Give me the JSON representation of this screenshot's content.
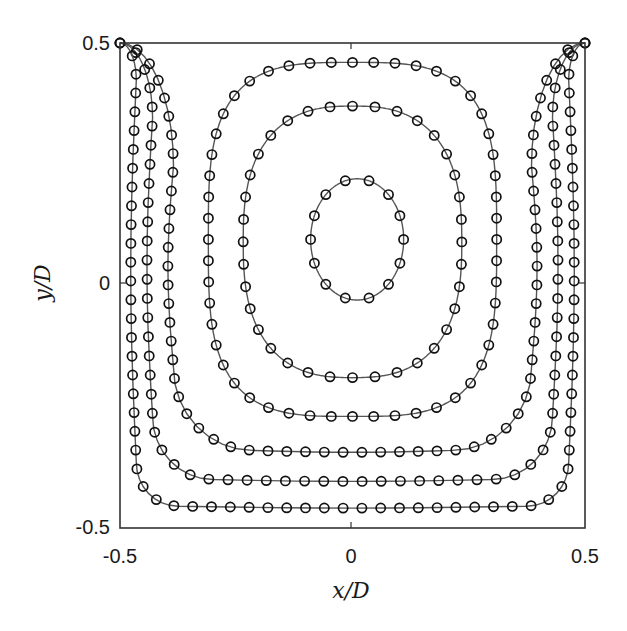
{
  "chart_data": {
    "type": "line",
    "title": "",
    "xlabel": "x/D",
    "ylabel": "y/D",
    "xlim": [
      -0.5,
      0.5
    ],
    "ylim": [
      -0.5,
      0.5
    ],
    "grid": false,
    "legend": null,
    "x_ticks": [
      -0.5,
      0,
      0.5
    ],
    "x_tick_labels": [
      "-0.5",
      "0",
      "0.5"
    ],
    "y_ticks": [
      -0.5,
      0,
      0.5
    ],
    "y_tick_labels": [
      "-0.5",
      "0",
      "0.5"
    ],
    "marker": "open-circle",
    "line_color": "#555555",
    "marker_color": "#111111",
    "series": [
      {
        "name": "contour-1 (closed, innermost)",
        "closed": true,
        "cx": 0.01,
        "cy": 0.095,
        "rx": 0.1,
        "ry": 0.125,
        "n_markers": 14,
        "extent": {
          "xmin": -0.09,
          "xmax": 0.11,
          "ymin": -0.03,
          "ymax": 0.22
        }
      },
      {
        "name": "contour-2 (closed)",
        "closed": true,
        "cx": 0.0,
        "cy": 0.09,
        "rx": 0.235,
        "ry": 0.28,
        "squareness": 2.6,
        "n_markers": 36,
        "extent": {
          "xmin": -0.24,
          "xmax": 0.23,
          "ymin": -0.19,
          "ymax": 0.37
        }
      },
      {
        "name": "contour-3 (closed)",
        "closed": true,
        "cx": 0.0,
        "cy": 0.095,
        "rx": 0.31,
        "ry": 0.365,
        "squareness": 3.4,
        "n_markers": 52,
        "extent": {
          "xmin": -0.31,
          "xmax": 0.31,
          "ymin": -0.27,
          "ymax": 0.46
        }
      },
      {
        "name": "contour-4 (open, wall-attached)",
        "closed": false,
        "x_wall": 0.385,
        "y_bottom": -0.34,
        "corner_r": 0.17,
        "n_markers": 62,
        "extent": {
          "xmin": -0.5,
          "xmax": 0.5,
          "ymin": -0.34,
          "ymax": 0.5
        }
      },
      {
        "name": "contour-5 (open, wall-attached)",
        "closed": false,
        "x_wall": 0.43,
        "y_bottom": -0.4,
        "corner_r": 0.13,
        "n_markers": 66,
        "extent": {
          "xmin": -0.5,
          "xmax": 0.5,
          "ymin": -0.4,
          "ymax": 0.5
        }
      },
      {
        "name": "contour-6 (open, wall-attached)",
        "closed": false,
        "x_wall": 0.465,
        "y_bottom": -0.455,
        "corner_r": 0.09,
        "n_markers": 72,
        "extent": {
          "xmin": -0.5,
          "xmax": 0.5,
          "ymin": -0.455,
          "ymax": 0.5
        }
      }
    ]
  },
  "axes": {
    "x_label": "x/D",
    "y_label": "y/D",
    "x_tick_labels": [
      "-0.5",
      "0",
      "0.5"
    ],
    "y_tick_labels": [
      "0.5",
      "0",
      "-0.5"
    ]
  }
}
